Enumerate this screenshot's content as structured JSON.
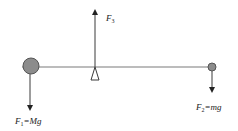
{
  "diagram": {
    "type": "lever-force-diagram",
    "colors": {
      "line": "#3a3a3a",
      "beam": "#7a7a7a",
      "mass_fill": "#8c8c8c",
      "mass_stroke": "#555555",
      "text": "#222222"
    },
    "beam": {
      "x1": 22,
      "x2": 212,
      "y": 67
    },
    "fulcrum": {
      "x": 95,
      "top_y": 67,
      "bottom_y": 80,
      "half_width": 4
    },
    "masses": [
      {
        "id": "large-mass",
        "cx": 31,
        "cy": 66,
        "r": 8
      },
      {
        "id": "small-mass",
        "cx": 212,
        "cy": 67,
        "r": 4
      }
    ],
    "forces": [
      {
        "id": "F1",
        "direction": "down",
        "x": 30,
        "y_start": 74,
        "y_end": 108,
        "label": {
          "main": "F",
          "sub": "1",
          "rest": "=Mg",
          "x": 15,
          "y": 124
        }
      },
      {
        "id": "F2",
        "direction": "down",
        "x": 212,
        "y_start": 71,
        "y_end": 90,
        "label": {
          "main": "F",
          "sub": "2",
          "rest": "=mg",
          "x": 196,
          "y": 110
        }
      },
      {
        "id": "F3",
        "direction": "up",
        "x": 95,
        "y_start": 67,
        "y_end": 12,
        "label": {
          "main": "F",
          "sub": "3",
          "rest": "",
          "x": 106,
          "y": 21
        }
      }
    ]
  }
}
